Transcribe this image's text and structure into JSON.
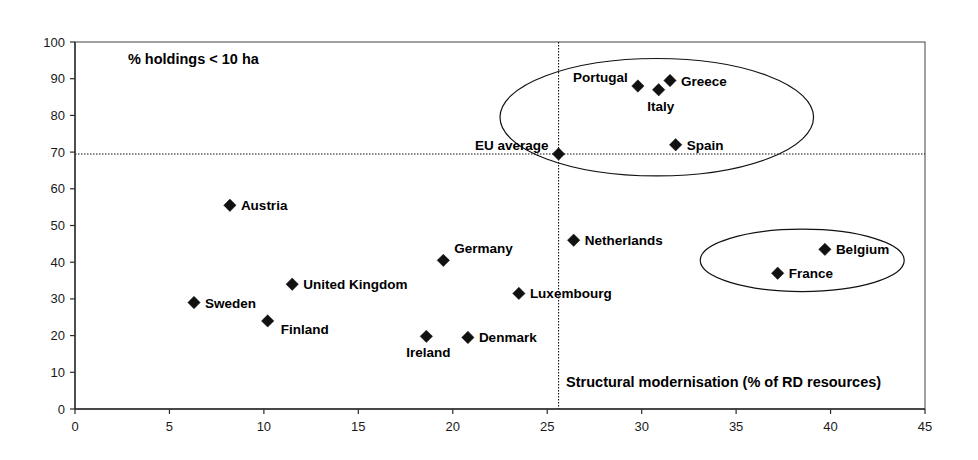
{
  "chart_data": {
    "type": "scatter",
    "title": "",
    "subtitle": "",
    "xlabel": "Structural modernisation (% of RD resources)",
    "ylabel": "% holdings < 10 ha",
    "xlim": [
      0,
      45
    ],
    "ylim": [
      0,
      100
    ],
    "x_ticks": [
      0,
      5,
      10,
      15,
      20,
      25,
      30,
      35,
      40,
      45
    ],
    "y_ticks": [
      0,
      10,
      20,
      30,
      40,
      50,
      60,
      70,
      80,
      90,
      100
    ],
    "grid": false,
    "legend": "none",
    "points": [
      {
        "label": "Sweden",
        "x": 6.3,
        "y": 29.0,
        "label_pos": "right"
      },
      {
        "label": "Austria",
        "x": 8.2,
        "y": 55.5,
        "label_pos": "right"
      },
      {
        "label": "Finland",
        "x": 10.2,
        "y": 24.0,
        "label_pos": "right-low"
      },
      {
        "label": "United Kingdom",
        "x": 11.5,
        "y": 34.0,
        "label_pos": "right"
      },
      {
        "label": "Ireland",
        "x": 18.6,
        "y": 19.8,
        "label_pos": "below"
      },
      {
        "label": "Germany",
        "x": 19.5,
        "y": 40.5,
        "label_pos": "above-right"
      },
      {
        "label": "Denmark",
        "x": 20.8,
        "y": 19.5,
        "label_pos": "right"
      },
      {
        "label": "Luxembourg",
        "x": 23.5,
        "y": 31.5,
        "label_pos": "right"
      },
      {
        "label": "EU average",
        "x": 25.6,
        "y": 69.5,
        "label_pos": "left-above"
      },
      {
        "label": "Netherlands",
        "x": 26.4,
        "y": 46.0,
        "label_pos": "right"
      },
      {
        "label": "Portugal",
        "x": 29.8,
        "y": 88.0,
        "label_pos": "left-above"
      },
      {
        "label": "Italy",
        "x": 30.9,
        "y": 87.0,
        "label_pos": "below"
      },
      {
        "label": "Greece",
        "x": 31.5,
        "y": 89.5,
        "label_pos": "right"
      },
      {
        "label": "Spain",
        "x": 31.8,
        "y": 72.0,
        "label_pos": "right"
      },
      {
        "label": "France",
        "x": 37.2,
        "y": 37.0,
        "label_pos": "right"
      },
      {
        "label": "Belgium",
        "x": 39.7,
        "y": 43.5,
        "label_pos": "right"
      }
    ],
    "reference_lines": [
      {
        "name": "eu-average-horizontal",
        "orientation": "horizontal",
        "value": 69.5,
        "style": "dotted"
      },
      {
        "name": "eu-average-vertical",
        "orientation": "vertical",
        "value": 25.6,
        "style": "dotted"
      }
    ],
    "annotations": [
      {
        "name": "y-axis-note",
        "text": "% holdings < 10 ha",
        "x": 2.8,
        "y": 94.0
      },
      {
        "name": "x-axis-title",
        "text": "Structural modernisation (% of RD resources)",
        "x": 26.0,
        "y": 6.0
      }
    ],
    "cluster_ellipses": [
      {
        "name": "southern-europe-cluster",
        "cx": 30.8,
        "cy": 79.5,
        "rx": 8.3,
        "ry": 16.0
      },
      {
        "name": "belgium-france-cluster",
        "cx": 38.5,
        "cy": 40.5,
        "rx": 5.4,
        "ry": 8.5
      }
    ],
    "colors": {
      "marker": "#111111",
      "axis": "#2b2b2b",
      "frame": "#555555",
      "text": "#000000",
      "background": "#ffffff"
    }
  },
  "geometry": {
    "plot_left": 75,
    "plot_right": 925,
    "plot_top": 42,
    "plot_bottom": 409
  }
}
